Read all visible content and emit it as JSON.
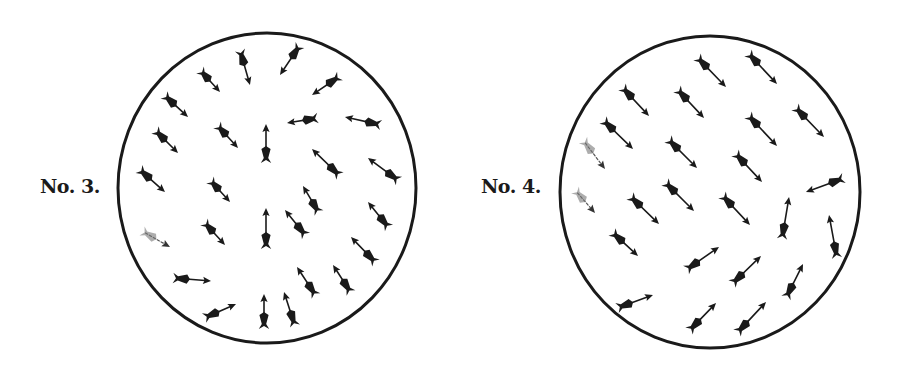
{
  "figures": [
    {
      "label": "No. 3.",
      "circle": {
        "cx": 267,
        "cy": 188,
        "rx": 149,
        "ry": 155
      },
      "arrows": [
        {
          "tail": [
            240,
            50
          ],
          "head": [
            250,
            85
          ]
        },
        {
          "tail": [
            300,
            45
          ],
          "head": [
            280,
            75
          ]
        },
        {
          "tail": [
            200,
            70
          ],
          "head": [
            220,
            92
          ]
        },
        {
          "tail": [
            340,
            76
          ],
          "head": [
            312,
            95
          ]
        },
        {
          "tail": [
            164,
            95
          ],
          "head": [
            188,
            117
          ]
        },
        {
          "tail": [
            155,
            130
          ],
          "head": [
            178,
            153
          ]
        },
        {
          "tail": [
            217,
            125
          ],
          "head": [
            238,
            148
          ]
        },
        {
          "tail": [
            266,
            163
          ],
          "head": [
            266,
            124
          ]
        },
        {
          "tail": [
            318,
            118
          ],
          "head": [
            287,
            123
          ]
        },
        {
          "tail": [
            381,
            125
          ],
          "head": [
            345,
            117
          ]
        },
        {
          "tail": [
            139,
            169
          ],
          "head": [
            165,
            192
          ]
        },
        {
          "tail": [
            210,
            180
          ],
          "head": [
            230,
            202
          ]
        },
        {
          "tail": [
            340,
            176
          ],
          "head": [
            312,
            149
          ]
        },
        {
          "tail": [
            399,
            181
          ],
          "head": [
            368,
            158
          ]
        },
        {
          "tail": [
            319,
            213
          ],
          "head": [
            303,
            186
          ]
        },
        {
          "tail": [
            142,
            231
          ],
          "head": [
            170,
            247
          ],
          "faint": true
        },
        {
          "tail": [
            204,
            222
          ],
          "head": [
            225,
            245
          ]
        },
        {
          "tail": [
            266,
            249
          ],
          "head": [
            266,
            208
          ]
        },
        {
          "tail": [
            306,
            236
          ],
          "head": [
            285,
            210
          ]
        },
        {
          "tail": [
            389,
            228
          ],
          "head": [
            368,
            202
          ]
        },
        {
          "tail": [
            376,
            263
          ],
          "head": [
            351,
            237
          ]
        },
        {
          "tail": [
            173,
            278
          ],
          "head": [
            211,
            281
          ]
        },
        {
          "tail": [
            316,
            296
          ],
          "head": [
            297,
            267
          ]
        },
        {
          "tail": [
            351,
            293
          ],
          "head": [
            333,
            265
          ]
        },
        {
          "tail": [
            204,
            318
          ],
          "head": [
            236,
            304
          ]
        },
        {
          "tail": [
            264,
            329
          ],
          "head": [
            264,
            294
          ]
        },
        {
          "tail": [
            295,
            326
          ],
          "head": [
            284,
            292
          ]
        }
      ]
    },
    {
      "label": "No. 4.",
      "circle": {
        "cx": 710,
        "cy": 192,
        "rx": 150,
        "ry": 156
      },
      "arrows": [
        {
          "tail": [
            697,
            57
          ],
          "head": [
            726,
            87
          ]
        },
        {
          "tail": [
            748,
            53
          ],
          "head": [
            777,
            84
          ]
        },
        {
          "tail": [
            622,
            87
          ],
          "head": [
            649,
            116
          ]
        },
        {
          "tail": [
            677,
            89
          ],
          "head": [
            704,
            118
          ]
        },
        {
          "tail": [
            795,
            107
          ],
          "head": [
            824,
            137
          ]
        },
        {
          "tail": [
            748,
            115
          ],
          "head": [
            777,
            146
          ]
        },
        {
          "tail": [
            603,
            120
          ],
          "head": [
            633,
            149
          ]
        },
        {
          "tail": [
            668,
            139
          ],
          "head": [
            697,
            168
          ]
        },
        {
          "tail": [
            735,
            153
          ],
          "head": [
            762,
            182
          ]
        },
        {
          "tail": [
            583,
            140
          ],
          "head": [
            605,
            169
          ],
          "faint": true
        },
        {
          "tail": [
            844,
            178
          ],
          "head": [
            806,
            192
          ]
        },
        {
          "tail": [
            665,
            182
          ],
          "head": [
            694,
            211
          ]
        },
        {
          "tail": [
            630,
            196
          ],
          "head": [
            659,
            224
          ]
        },
        {
          "tail": [
            722,
            195
          ],
          "head": [
            750,
            225
          ]
        },
        {
          "tail": [
            575,
            190
          ],
          "head": [
            595,
            213
          ],
          "faint": true
        },
        {
          "tail": [
            782,
            239
          ],
          "head": [
            789,
            197
          ]
        },
        {
          "tail": [
            837,
            258
          ],
          "head": [
            829,
            215
          ]
        },
        {
          "tail": [
            612,
            232
          ],
          "head": [
            638,
            256
          ]
        },
        {
          "tail": [
            686,
            270
          ],
          "head": [
            719,
            247
          ]
        },
        {
          "tail": [
            732,
            284
          ],
          "head": [
            761,
            256
          ]
        },
        {
          "tail": [
            786,
            298
          ],
          "head": [
            803,
            264
          ]
        },
        {
          "tail": [
            617,
            308
          ],
          "head": [
            653,
            295
          ]
        },
        {
          "tail": [
            689,
            331
          ],
          "head": [
            716,
            303
          ]
        },
        {
          "tail": [
            737,
            333
          ],
          "head": [
            766,
            302
          ]
        }
      ]
    }
  ],
  "colors": {
    "ink": "#1a1a1a",
    "paper": "#ffffff"
  }
}
